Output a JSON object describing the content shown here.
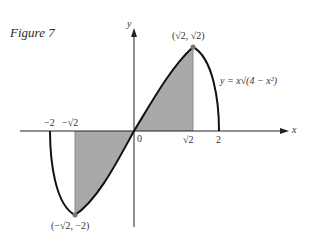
{
  "figure": {
    "title": "Figure 7",
    "equation": "y = x√(4 − x²)",
    "axis_x_label": "x",
    "axis_y_label": "y",
    "origin_label": "0",
    "tick_labels": {
      "neg_two": "−2",
      "neg_sqrt2": "−√2",
      "sqrt2": "√2",
      "two": "2"
    },
    "max_point_label": "(√2, √2)",
    "min_point_label": "(−√2, −2)",
    "colors": {
      "curve": "#111111",
      "shade": "#a9a9a9",
      "axis": "#222222",
      "point": "#777777"
    }
  }
}
